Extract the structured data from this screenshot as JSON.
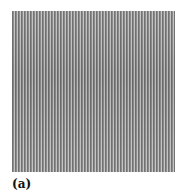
{
  "figure": {
    "panel_label": "(a)",
    "image_description": "grayscale vertical stripe grating pattern",
    "colors": {
      "dark_stripe": "#6e6e6e",
      "mid_stripe": "#8a8a8a",
      "light_stripe": "#c4c4c4"
    }
  }
}
